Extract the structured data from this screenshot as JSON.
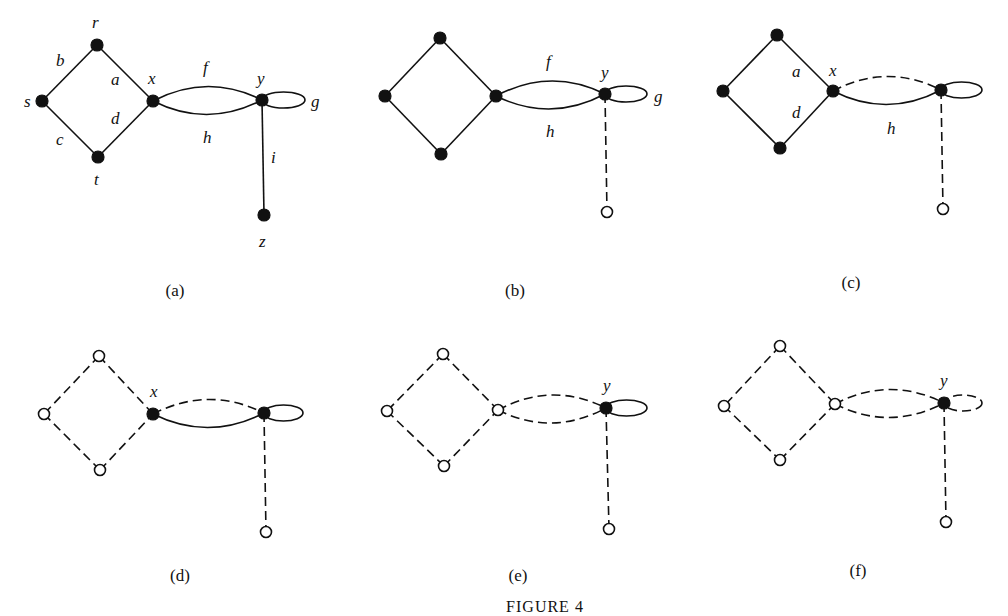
{
  "figure": {
    "caption": "FIGURE 4",
    "caption_pos": [
      545,
      612
    ]
  },
  "panels": [
    {
      "id": "a",
      "caption": "(a)",
      "caption_pos": [
        175,
        296
      ],
      "vertices": {
        "r": {
          "x": 97,
          "y": 45,
          "filled": true
        },
        "s": {
          "x": 42,
          "y": 101,
          "filled": true
        },
        "x": {
          "x": 153,
          "y": 101,
          "filled": true
        },
        "t": {
          "x": 98,
          "y": 157,
          "filled": true
        },
        "y": {
          "x": 262,
          "y": 100,
          "filled": true
        },
        "z": {
          "x": 264,
          "y": 215,
          "filled": true
        }
      },
      "edges": [
        {
          "name": "b",
          "from": "r",
          "to": "s",
          "dashed": false
        },
        {
          "name": "a",
          "from": "r",
          "to": "x",
          "dashed": false
        },
        {
          "name": "c",
          "from": "s",
          "to": "t",
          "dashed": false
        },
        {
          "name": "d",
          "from": "t",
          "to": "x",
          "dashed": false
        },
        {
          "name": "f",
          "from": "x",
          "to": "y",
          "curve": "upper",
          "dashed": false
        },
        {
          "name": "h",
          "from": "x",
          "to": "y",
          "curve": "lower",
          "dashed": false
        },
        {
          "name": "g",
          "from": "y",
          "to": "y",
          "loop": true,
          "loop_right": 305,
          "dashed": false
        },
        {
          "name": "i",
          "from": "y",
          "to": "z",
          "dashed": false
        }
      ],
      "labels": [
        {
          "text": "r",
          "x": 92,
          "y": 28
        },
        {
          "text": "b",
          "x": 56,
          "y": 66
        },
        {
          "text": "a",
          "x": 111,
          "y": 85
        },
        {
          "text": "x",
          "x": 148,
          "y": 84
        },
        {
          "text": "s",
          "x": 24,
          "y": 107
        },
        {
          "text": "c",
          "x": 56,
          "y": 145
        },
        {
          "text": "d",
          "x": 111,
          "y": 124
        },
        {
          "text": "t",
          "x": 94,
          "y": 185
        },
        {
          "text": "f",
          "x": 203,
          "y": 73
        },
        {
          "text": "y",
          "x": 257,
          "y": 84
        },
        {
          "text": "g",
          "x": 311,
          "y": 107
        },
        {
          "text": "h",
          "x": 203,
          "y": 143
        },
        {
          "text": "i",
          "x": 271,
          "y": 163
        },
        {
          "text": "z",
          "x": 259,
          "y": 247
        }
      ]
    },
    {
      "id": "b",
      "caption": "(b)",
      "caption_pos": [
        515,
        296
      ],
      "vertices": {
        "r": {
          "x": 440,
          "y": 38,
          "filled": true
        },
        "s": {
          "x": 385,
          "y": 96,
          "filled": true
        },
        "x": {
          "x": 496,
          "y": 96,
          "filled": true
        },
        "t": {
          "x": 441,
          "y": 154,
          "filled": true
        },
        "y": {
          "x": 605,
          "y": 94,
          "filled": true
        },
        "z": {
          "x": 607,
          "y": 212,
          "filled": false
        }
      },
      "edges": [
        {
          "name": "b",
          "from": "r",
          "to": "s",
          "dashed": false
        },
        {
          "name": "a",
          "from": "r",
          "to": "x",
          "dashed": false
        },
        {
          "name": "c",
          "from": "s",
          "to": "t",
          "dashed": false
        },
        {
          "name": "d",
          "from": "t",
          "to": "x",
          "dashed": false
        },
        {
          "name": "f",
          "from": "x",
          "to": "y",
          "curve": "upper",
          "dashed": false
        },
        {
          "name": "h",
          "from": "x",
          "to": "y",
          "curve": "lower",
          "dashed": false
        },
        {
          "name": "g",
          "from": "y",
          "to": "y",
          "loop": true,
          "loop_right": 647,
          "dashed": false
        },
        {
          "name": "i",
          "from": "y",
          "to": "z",
          "dashed": true
        }
      ],
      "labels": [
        {
          "text": "f",
          "x": 546,
          "y": 67
        },
        {
          "text": "y",
          "x": 601,
          "y": 78
        },
        {
          "text": "g",
          "x": 654,
          "y": 102
        },
        {
          "text": "h",
          "x": 546,
          "y": 137
        }
      ]
    },
    {
      "id": "c",
      "caption": "(c)",
      "caption_pos": [
        851,
        288
      ],
      "vertices": {
        "r": {
          "x": 777,
          "y": 35,
          "filled": true
        },
        "s": {
          "x": 723,
          "y": 91,
          "filled": true
        },
        "x": {
          "x": 833,
          "y": 91,
          "filled": true
        },
        "t": {
          "x": 780,
          "y": 148,
          "filled": true
        },
        "y": {
          "x": 941,
          "y": 90,
          "filled": true
        },
        "z": {
          "x": 943,
          "y": 209,
          "filled": false
        }
      },
      "edges": [
        {
          "name": "b",
          "from": "r",
          "to": "s",
          "dashed": false
        },
        {
          "name": "a",
          "from": "r",
          "to": "x",
          "dashed": false
        },
        {
          "name": "c",
          "from": "s",
          "to": "t",
          "dashed": false
        },
        {
          "name": "d",
          "from": "t",
          "to": "x",
          "dashed": false
        },
        {
          "name": "f",
          "from": "x",
          "to": "y",
          "curve": "upper",
          "dashed": true
        },
        {
          "name": "h",
          "from": "x",
          "to": "y",
          "curve": "lower",
          "dashed": false
        },
        {
          "name": "g",
          "from": "y",
          "to": "y",
          "loop": true,
          "loop_right": 982,
          "dashed": false
        },
        {
          "name": "i",
          "from": "y",
          "to": "z",
          "dashed": true
        }
      ],
      "labels": [
        {
          "text": "a",
          "x": 792,
          "y": 77
        },
        {
          "text": "x",
          "x": 829,
          "y": 76
        },
        {
          "text": "d",
          "x": 792,
          "y": 118
        },
        {
          "text": "h",
          "x": 887,
          "y": 134
        }
      ]
    },
    {
      "id": "d",
      "caption": "(d)",
      "caption_pos": [
        180,
        581
      ],
      "vertices": {
        "r": {
          "x": 99,
          "y": 356,
          "filled": false
        },
        "s": {
          "x": 44,
          "y": 414,
          "filled": false
        },
        "x": {
          "x": 153,
          "y": 414,
          "filled": true
        },
        "t": {
          "x": 100,
          "y": 470,
          "filled": false
        },
        "y": {
          "x": 264,
          "y": 413,
          "filled": true
        },
        "z": {
          "x": 266,
          "y": 532,
          "filled": false
        }
      },
      "edges": [
        {
          "name": "b",
          "from": "r",
          "to": "s",
          "dashed": true
        },
        {
          "name": "a",
          "from": "r",
          "to": "x",
          "dashed": true
        },
        {
          "name": "c",
          "from": "s",
          "to": "t",
          "dashed": true
        },
        {
          "name": "d",
          "from": "t",
          "to": "x",
          "dashed": true
        },
        {
          "name": "f",
          "from": "x",
          "to": "y",
          "curve": "upper",
          "dashed": true
        },
        {
          "name": "h",
          "from": "x",
          "to": "y",
          "curve": "lower",
          "dashed": false
        },
        {
          "name": "g",
          "from": "y",
          "to": "y",
          "loop": true,
          "loop_right": 303,
          "dashed": false
        },
        {
          "name": "i",
          "from": "y",
          "to": "z",
          "dashed": true
        }
      ],
      "labels": [
        {
          "text": "x",
          "x": 150,
          "y": 397
        }
      ]
    },
    {
      "id": "e",
      "caption": "(e)",
      "caption_pos": [
        518,
        581
      ],
      "vertices": {
        "r": {
          "x": 443,
          "y": 354,
          "filled": false
        },
        "s": {
          "x": 387,
          "y": 411,
          "filled": false
        },
        "x": {
          "x": 498,
          "y": 410,
          "filled": false
        },
        "t": {
          "x": 444,
          "y": 466,
          "filled": false
        },
        "y": {
          "x": 606,
          "y": 408,
          "filled": true
        },
        "z": {
          "x": 609,
          "y": 529,
          "filled": false
        }
      },
      "edges": [
        {
          "name": "b",
          "from": "r",
          "to": "s",
          "dashed": true
        },
        {
          "name": "a",
          "from": "r",
          "to": "x",
          "dashed": true
        },
        {
          "name": "c",
          "from": "s",
          "to": "t",
          "dashed": true
        },
        {
          "name": "d",
          "from": "t",
          "to": "x",
          "dashed": true
        },
        {
          "name": "f",
          "from": "x",
          "to": "y",
          "curve": "upper",
          "dashed": true
        },
        {
          "name": "h",
          "from": "x",
          "to": "y",
          "curve": "lower",
          "dashed": true
        },
        {
          "name": "g",
          "from": "y",
          "to": "y",
          "loop": true,
          "loop_right": 647,
          "dashed": false
        },
        {
          "name": "i",
          "from": "y",
          "to": "z",
          "dashed": true
        }
      ],
      "labels": [
        {
          "text": "y",
          "x": 603,
          "y": 391
        }
      ]
    },
    {
      "id": "f",
      "caption": "(f)",
      "caption_pos": [
        858,
        576
      ],
      "vertices": {
        "r": {
          "x": 780,
          "y": 346,
          "filled": false
        },
        "s": {
          "x": 724,
          "y": 406,
          "filled": false
        },
        "x": {
          "x": 835,
          "y": 404,
          "filled": false
        },
        "t": {
          "x": 780,
          "y": 460,
          "filled": false
        },
        "y": {
          "x": 944,
          "y": 403,
          "filled": true
        },
        "z": {
          "x": 946,
          "y": 522,
          "filled": false
        }
      },
      "edges": [
        {
          "name": "b",
          "from": "r",
          "to": "s",
          "dashed": true
        },
        {
          "name": "a",
          "from": "r",
          "to": "x",
          "dashed": true
        },
        {
          "name": "c",
          "from": "s",
          "to": "t",
          "dashed": true
        },
        {
          "name": "d",
          "from": "t",
          "to": "x",
          "dashed": true
        },
        {
          "name": "f",
          "from": "x",
          "to": "y",
          "curve": "upper",
          "dashed": true
        },
        {
          "name": "h",
          "from": "x",
          "to": "y",
          "curve": "lower",
          "dashed": true
        },
        {
          "name": "g",
          "from": "y",
          "to": "y",
          "loop": true,
          "loop_right": 982,
          "dashed": true
        },
        {
          "name": "i",
          "from": "y",
          "to": "z",
          "dashed": true
        }
      ],
      "labels": [
        {
          "text": "y",
          "x": 940,
          "y": 386
        }
      ]
    }
  ]
}
